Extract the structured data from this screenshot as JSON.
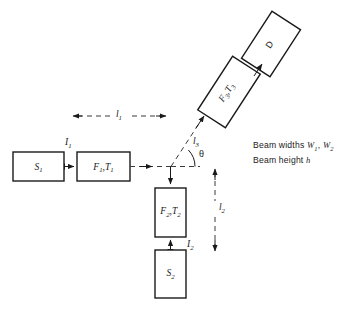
{
  "figure": {
    "background_color": "#ffffff",
    "line_color": "#1a1a1a",
    "dashed_color": "#3a3a3a"
  },
  "boxes": {
    "source1": {
      "label": "S",
      "subscript": "1",
      "name": "source-1-box"
    },
    "filter1": {
      "label": "F",
      "subscript": "1",
      "label2": "T",
      "subscript2": "1",
      "name": "filter-1-box"
    },
    "filter2": {
      "label": "F",
      "subscript": "2",
      "label2": "T",
      "subscript2": "2",
      "name": "filter-2-box"
    },
    "source2": {
      "label": "S",
      "subscript": "2",
      "name": "source-2-box"
    },
    "filter3": {
      "label": "F",
      "subscript": "3",
      "label2": "T",
      "subscript2": "3",
      "name": "filter-3-box"
    },
    "detector": {
      "label": "D",
      "name": "detector-box"
    }
  },
  "beam_labels": {
    "i1": {
      "symbol": "I",
      "subscript": "1"
    },
    "i2": {
      "symbol": "I",
      "subscript": "2"
    }
  },
  "dimensions": {
    "l1": {
      "symbol": "l",
      "subscript": "1",
      "orientation": "horizontal"
    },
    "l2": {
      "symbol": "l",
      "subscript": "2",
      "orientation": "vertical"
    },
    "l3": {
      "symbol": "l",
      "subscript": "3",
      "orientation": "diagonal"
    }
  },
  "angle": {
    "symbol": "θ",
    "name": "theta-angle"
  },
  "notes": {
    "line1_prefix": "Beam widths",
    "line1_sym1": "W",
    "line1_sub1": "1",
    "line1_sep": ",",
    "line1_sym2": "W",
    "line1_sub2": "2",
    "line2_prefix": "Beam height",
    "line2_sym": "h"
  }
}
